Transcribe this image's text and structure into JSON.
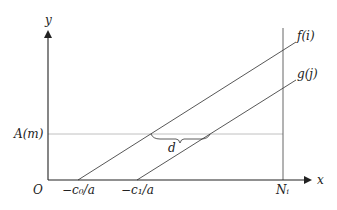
{
  "diagram": {
    "axes": {
      "x_label": "x",
      "y_label": "y",
      "origin_label": "O"
    },
    "lines": [
      {
        "name": "f",
        "label": "f(i)",
        "x_intercept_label": "−c₀/a"
      },
      {
        "name": "g",
        "label": "g(j)",
        "x_intercept_label": "−c₁/a"
      }
    ],
    "horizontal_level": {
      "label": "A(m)"
    },
    "vertical_bound": {
      "label": "Nᵢ"
    },
    "distance": {
      "label": "d"
    },
    "colors": {
      "axis": "#222222",
      "lines": "#444444",
      "level_line": "#aaaaaa",
      "text": "#222222"
    }
  }
}
